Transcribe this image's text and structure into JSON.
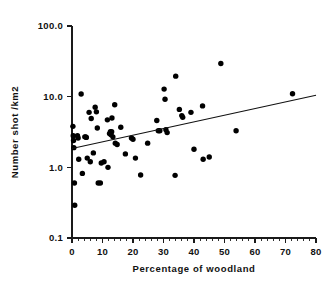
{
  "chart_data": {
    "type": "scatter",
    "title": "",
    "xlabel": "Percentage of woodland",
    "ylabel": "Number shot /km2",
    "xlim": [
      0,
      80
    ],
    "ylim": [
      0.1,
      100.0
    ],
    "yscale": "log",
    "xscale": "linear",
    "grid": false,
    "legend": null,
    "xticks": [
      0,
      10,
      20,
      30,
      40,
      50,
      60,
      70,
      80
    ],
    "xticklabels": [
      "0",
      "10",
      "20",
      "30",
      "40",
      "50",
      "60",
      "70",
      "80"
    ],
    "xminor_ticks_per_interval": 4,
    "yticks": [
      0.1,
      1.0,
      10.0,
      100.0
    ],
    "yticklabels": [
      "0.1",
      "1.0",
      "10.0",
      "100.0"
    ],
    "series": [
      {
        "name": "observations",
        "marker": "filled-circle",
        "color": "#000000",
        "points": [
          [
            0.3,
            3.8
          ],
          [
            0.4,
            2.8
          ],
          [
            0.5,
            2.4
          ],
          [
            0.6,
            1.9
          ],
          [
            0.8,
            0.6
          ],
          [
            0.9,
            0.29
          ],
          [
            1.8,
            2.8
          ],
          [
            2.0,
            2.6
          ],
          [
            2.2,
            1.3
          ],
          [
            3.0,
            10.9
          ],
          [
            3.4,
            0.82
          ],
          [
            4.2,
            2.7
          ],
          [
            4.5,
            2.7
          ],
          [
            4.7,
            2.65
          ],
          [
            5.0,
            1.35
          ],
          [
            5.6,
            6.0
          ],
          [
            6.0,
            1.2
          ],
          [
            6.3,
            4.9
          ],
          [
            7.0,
            1.6
          ],
          [
            7.6,
            7.1
          ],
          [
            8.0,
            6.1
          ],
          [
            8.3,
            3.6
          ],
          [
            8.6,
            0.6
          ],
          [
            9.3,
            0.6
          ],
          [
            9.6,
            1.15
          ],
          [
            10.5,
            1.2
          ],
          [
            11.6,
            4.7
          ],
          [
            11.8,
            1.0
          ],
          [
            12.3,
            3.0
          ],
          [
            12.6,
            3.2
          ],
          [
            12.8,
            2.9
          ],
          [
            13.0,
            3.2
          ],
          [
            13.1,
            5.0
          ],
          [
            13.4,
            2.7
          ],
          [
            14.0,
            7.7
          ],
          [
            14.2,
            2.2
          ],
          [
            14.8,
            2.1
          ],
          [
            16.0,
            3.7
          ],
          [
            17.5,
            1.55
          ],
          [
            19.5,
            2.6
          ],
          [
            20.0,
            2.5
          ],
          [
            20.8,
            1.35
          ],
          [
            22.5,
            0.78
          ],
          [
            24.8,
            2.2
          ],
          [
            27.8,
            4.6
          ],
          [
            28.3,
            3.3
          ],
          [
            28.8,
            3.3
          ],
          [
            30.2,
            12.8
          ],
          [
            30.5,
            9.2
          ],
          [
            30.8,
            3.4
          ],
          [
            31.2,
            3.1
          ],
          [
            33.8,
            0.77
          ],
          [
            34.0,
            19.5
          ],
          [
            35.2,
            6.6
          ],
          [
            36.0,
            5.4
          ],
          [
            36.3,
            5.1
          ],
          [
            39.0,
            6.0
          ],
          [
            40.0,
            1.8
          ],
          [
            42.8,
            7.4
          ],
          [
            43.0,
            1.3
          ],
          [
            45.0,
            1.4
          ],
          [
            48.8,
            29.5
          ],
          [
            53.8,
            3.3
          ],
          [
            72.3,
            11.0
          ]
        ]
      }
    ],
    "annotations": [
      {
        "type": "regression-line",
        "x_start": 0,
        "y_start": 1.85,
        "x_end": 80,
        "y_end": 10.5
      }
    ]
  }
}
